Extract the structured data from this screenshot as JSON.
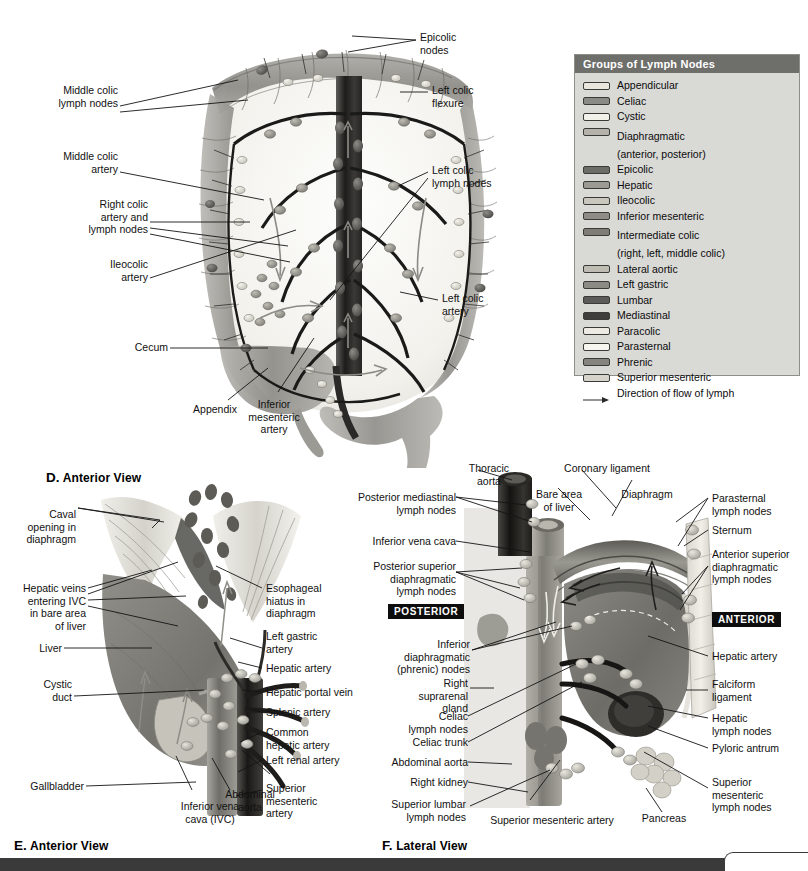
{
  "legend": {
    "title": "Groups of Lymph Nodes",
    "items": [
      {
        "label": "Appendicular",
        "sub": "",
        "color": "#e8e6dd"
      },
      {
        "label": "Celiac",
        "sub": "",
        "color": "#8a8a86"
      },
      {
        "label": "Cystic",
        "sub": "",
        "color": "#f2f1ea"
      },
      {
        "label": "Diaphragmatic",
        "sub": "(anterior, posterior)",
        "color": "#b4b2a9"
      },
      {
        "label": "Epicolic",
        "sub": "",
        "color": "#6d6d68"
      },
      {
        "label": "Hepatic",
        "sub": "",
        "color": "#9b9a93"
      },
      {
        "label": "Ileocolic",
        "sub": "",
        "color": "#c9c7bd"
      },
      {
        "label": "Inferior mesenteric",
        "sub": "",
        "color": "#8d8c86"
      },
      {
        "label": "Intermediate colic",
        "sub": "(right, left, middle colic)",
        "color": "#7d7c77"
      },
      {
        "label": "Lateral aortic",
        "sub": "",
        "color": "#bfbdb3"
      },
      {
        "label": "Left gastric",
        "sub": "",
        "color": "#8b8a84"
      },
      {
        "label": "Lumbar",
        "sub": "",
        "color": "#5c5b57"
      },
      {
        "label": "Mediastinal",
        "sub": "",
        "color": "#3f3e3b"
      },
      {
        "label": "Paracolic",
        "sub": "",
        "color": "#eceae2"
      },
      {
        "label": "Parasternal",
        "sub": "",
        "color": "#f7f6f1"
      },
      {
        "label": "Phrenic",
        "sub": "",
        "color": "#85847e"
      },
      {
        "label": "Superior mesenteric",
        "sub": "",
        "color": "#d6d4ca"
      }
    ],
    "flow_label": "Direction of flow of lymph",
    "header_bg": "#6e6e6b",
    "panel_bg": "#d9d9d6"
  },
  "panel_d": {
    "caption_letter": "D.",
    "caption_text": "Anterior View",
    "labels": {
      "epicolic_nodes": "Epicolic\nnodes",
      "middle_colic_lymph_nodes": "Middle colic\nlymph nodes",
      "left_colic_flexure": "Left colic\nflexure",
      "middle_colic_artery": "Middle colic\nartery",
      "left_colic_lymph_nodes": "Left colic\nlymph nodes",
      "right_colic_artery_and_lymph_nodes": "Right colic\nartery and\nlymph nodes",
      "ileocolic_artery": "Ileocolic\nartery",
      "left_colic_artery": "Left colic\nartery",
      "cecum": "Cecum",
      "appendix": "Appendix",
      "inferior_mesenteric_artery": "Inferior\nmesenteric\nartery"
    }
  },
  "panel_e": {
    "caption_letter": "E.",
    "caption_text": "Anterior View",
    "labels": {
      "caval_opening": "Caval\nopening in\ndiaphragm",
      "hepatic_veins": "Hepatic veins\nentering IVC\nin bare area\nof liver",
      "liver": "Liver",
      "cystic_duct": "Cystic\nduct",
      "gallbladder": "Gallbladder",
      "esophageal_hiatus": "Esophageal\nhiatus in\ndiaphragm",
      "left_gastric_artery": "Left gastric\nartery",
      "hepatic_artery": "Hepatic artery",
      "hepatic_portal_vein": "Hepatic portal vein",
      "splenic_artery": "Splenic artery",
      "common_hepatic_artery": "Common\nhepatic artery",
      "left_renal_artery": "Left renal artery",
      "superior_mesenteric_artery": "Superior\nmesenteric\nartery",
      "inferior_vena_cava_ivc": "Inferior vena\ncava (IVC)",
      "abdominal_aorta": "Abdominal\naorta"
    }
  },
  "panel_f": {
    "caption_letter": "F.",
    "caption_text": "Lateral View",
    "orientation_posterior": "POSTERIOR",
    "orientation_anterior": "ANTERIOR",
    "labels": {
      "thoracic_aorta": "Thoracic\naorta",
      "coronary_ligament": "Coronary ligament",
      "bare_area_of_liver": "Bare area\nof liver",
      "diaphragm": "Diaphragm",
      "parasternal_lymph_nodes": "Parasternal\nlymph nodes",
      "posterior_mediastinal_lymph_nodes": "Posterior mediastinal\nlymph nodes",
      "inferior_vena_cava": "Inferior vena cava",
      "sternum": "Sternum",
      "posterior_superior_diaphragmatic_lymph_nodes": "Posterior superior\ndiaphragmatic\nlymph nodes",
      "anterior_superior_diaphragmatic_lymph_nodes": "Anterior superior\ndiaphragmatic\nlymph nodes",
      "inferior_diaphragmatic_phrenic_nodes": "Inferior\ndiaphragmatic\n(phrenic) nodes",
      "right_suprarenal_gland": "Right\nsuprarenal\ngland",
      "hepatic_artery": "Hepatic artery",
      "falciform_ligament": "Falciform\nligament",
      "celiac_lymph_nodes": "Celiac\nlymph nodes",
      "hepatic_lymph_nodes": "Hepatic\nlymph nodes",
      "celiac_trunk": "Celiac trunk",
      "pyloric_antrum": "Pyloric antrum",
      "abdominal_aorta": "Abdominal aorta",
      "right_kidney": "Right kidney",
      "superior_lumbar_lymph_nodes": "Superior lumbar\nlymph nodes",
      "superior_mesenteric_artery": "Superior mesenteric artery",
      "pancreas": "Pancreas",
      "superior_mesenteric_lymph_nodes": "Superior\nmesenteric\nlymph nodes"
    }
  },
  "footer": {
    "bar_color": "#3a3a3a"
  }
}
